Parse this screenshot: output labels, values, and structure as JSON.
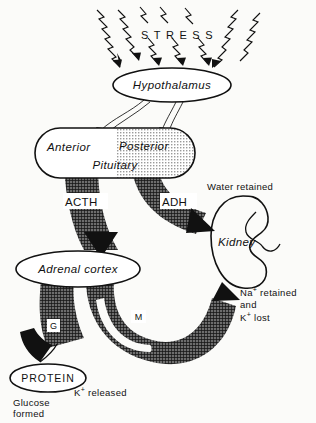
{
  "figure": {
    "background_color": "#fbfbf9",
    "ink_color": "#111111",
    "hatch_color": "#3a3a3a",
    "stipple_color": "#c8c8c8"
  },
  "stress": {
    "label": "STRESS",
    "bolt_count": 6
  },
  "nodes": {
    "hypothalamus": {
      "label": "Hypothalamus"
    },
    "pituitary": {
      "anterior_label": "Anterior",
      "posterior_label": "Posterior",
      "gland_label": "Pituitary"
    },
    "adrenal_cortex": {
      "label": "Adrenal cortex"
    },
    "kidney": {
      "label": "Kidney"
    },
    "protein": {
      "label": "PROTEIN"
    }
  },
  "hormones": {
    "acth": "ACTH",
    "adh": "ADH",
    "glucocorticoid": "G",
    "mineralocorticoid": "M"
  },
  "effects": {
    "water_retained": "Water retained",
    "na_retained_line1": "Na",
    "na_retained_sup": "+",
    "na_retained_rest": " retained",
    "na_retained_line2": "and",
    "k_lost_pre": "K",
    "k_lost_sup": "+",
    "k_lost_rest": " lost",
    "glucose_formed_line1": "Glucose",
    "glucose_formed_line2": "formed",
    "k_released_pre": "K",
    "k_released_sup": "+",
    "k_released_rest": " released"
  }
}
